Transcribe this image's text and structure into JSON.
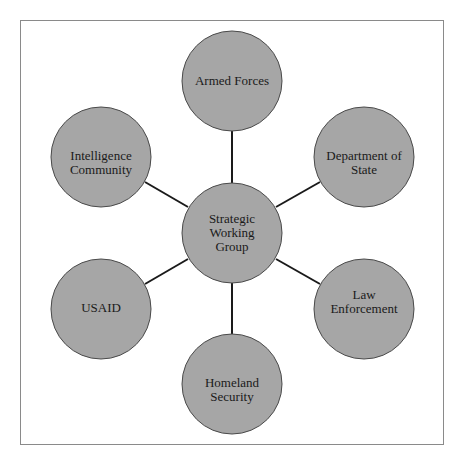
{
  "diagram": {
    "type": "hub-and-spoke",
    "colors": {
      "node_fill": "#a6a6a6",
      "node_stroke": "#4a4a4a",
      "edge": "#1a1a1a",
      "frame": "#8a8a8a"
    },
    "center": {
      "id": "hub",
      "label": "Strategic Working Group",
      "lines": [
        "Strategic",
        "Working",
        "Group"
      ]
    },
    "nodes": [
      {
        "id": "armed-forces",
        "label": "Armed Forces",
        "lines": [
          "Armed Forces"
        ]
      },
      {
        "id": "department-of-state",
        "label": "Department of State",
        "lines": [
          "Department of",
          "State"
        ]
      },
      {
        "id": "law-enforcement",
        "label": "Law Enforcement",
        "lines": [
          "Law",
          "Enforcement"
        ]
      },
      {
        "id": "homeland-security",
        "label": "Homeland Security",
        "lines": [
          "Homeland",
          "Security"
        ]
      },
      {
        "id": "usaid",
        "label": "USAID",
        "lines": [
          "USAID"
        ]
      },
      {
        "id": "intelligence-community",
        "label": "Intelligence Community",
        "lines": [
          "Intelligence",
          "Community"
        ]
      }
    ],
    "edges": [
      [
        "hub",
        "armed-forces"
      ],
      [
        "hub",
        "department-of-state"
      ],
      [
        "hub",
        "law-enforcement"
      ],
      [
        "hub",
        "homeland-security"
      ],
      [
        "hub",
        "usaid"
      ],
      [
        "hub",
        "intelligence-community"
      ]
    ]
  }
}
